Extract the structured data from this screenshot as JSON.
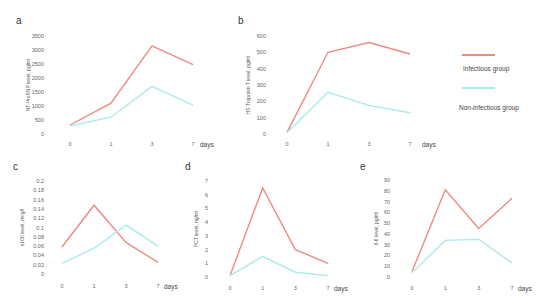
{
  "colors": {
    "infectious": "#f08a80",
    "non_infectious": "#a8ecec",
    "text": "#555555"
  },
  "legend": {
    "items": [
      {
        "label": "Infectious group",
        "color": "#f08a80"
      },
      {
        "label": "Non-infectious group",
        "color": "#a8ecec"
      }
    ]
  },
  "chart_data": [
    {
      "panel": "a",
      "type": "line",
      "title": "",
      "xlabel": "days",
      "ylabel": "NT-ProBNP level, pg/ml",
      "categories": [
        "0",
        "1",
        "3",
        "7"
      ],
      "yticks": [
        "0",
        "500",
        "1000",
        "1500",
        "2000",
        "2500",
        "3000",
        "3500"
      ],
      "ylim": [
        0,
        3500
      ],
      "grid": false,
      "series": [
        {
          "name": "Infectious group",
          "values": [
            320,
            1100,
            3150,
            2480
          ]
        },
        {
          "name": "Non-infectious group",
          "values": [
            290,
            600,
            1700,
            1030
          ]
        }
      ]
    },
    {
      "panel": "b",
      "type": "line",
      "title": "",
      "xlabel": "days",
      "ylabel": "HS Troponin T level, pg/ml",
      "categories": [
        "0",
        "1",
        "3",
        "7"
      ],
      "yticks": [
        "0",
        "100",
        "200",
        "300",
        "400",
        "500",
        "600"
      ],
      "ylim": [
        0,
        600
      ],
      "grid": false,
      "series": [
        {
          "name": "Infectious group",
          "values": [
            10,
            500,
            560,
            490
          ]
        },
        {
          "name": "Non-infectious group",
          "values": [
            10,
            255,
            175,
            130
          ]
        }
      ]
    },
    {
      "panel": "c",
      "type": "line",
      "title": "",
      "xlabel": "days",
      "ylabel": "s100 level, mcg/l",
      "categories": [
        "0",
        "1",
        "3",
        "7"
      ],
      "yticks": [
        "0",
        "0.02",
        "0.04",
        "0.06",
        "0.08",
        "0.1",
        "0.12",
        "0.14",
        "0.16",
        "0.18",
        "0.2"
      ],
      "ylim": [
        0,
        0.2
      ],
      "grid": false,
      "series": [
        {
          "name": "Infectious group",
          "values": [
            0.058,
            0.148,
            0.068,
            0.025
          ]
        },
        {
          "name": "Non-infectious group",
          "values": [
            0.023,
            0.055,
            0.105,
            0.06
          ]
        }
      ]
    },
    {
      "panel": "d",
      "type": "line",
      "title": "",
      "xlabel": "days",
      "ylabel": "PCT level, ng/ml",
      "categories": [
        "0",
        "1",
        "3",
        "7"
      ],
      "yticks": [
        "0",
        "1",
        "2",
        "3",
        "4",
        "5",
        "6",
        "7"
      ],
      "ylim": [
        0,
        7
      ],
      "grid": false,
      "series": [
        {
          "name": "Infectious group",
          "values": [
            0.1,
            6.5,
            2.0,
            1.0
          ]
        },
        {
          "name": "Non-infectious group",
          "values": [
            0.1,
            1.5,
            0.35,
            0.1
          ]
        }
      ]
    },
    {
      "panel": "e",
      "type": "line",
      "title": "",
      "xlabel": "days",
      "ylabel": "Il-6 level, pg/ml",
      "categories": [
        "0",
        "1",
        "3",
        "7"
      ],
      "yticks": [
        "0",
        "10",
        "20",
        "30",
        "40",
        "50",
        "60",
        "70",
        "80",
        "90"
      ],
      "ylim": [
        0,
        90
      ],
      "grid": false,
      "series": [
        {
          "name": "Infectious group",
          "values": [
            5,
            81,
            45,
            73
          ]
        },
        {
          "name": "Non-infectious group",
          "values": [
            4,
            34,
            35,
            13
          ]
        }
      ]
    }
  ],
  "layout": [
    {
      "panel": "a",
      "letter_pos": [
        16,
        16
      ],
      "plot": {
        "x0": 70,
        "x1": 193,
        "y0": 134,
        "ytop": 36
      },
      "ytick_x": 44,
      "ylabel_x": 30,
      "days_x": 200,
      "xtick_y": 146
    },
    {
      "panel": "b",
      "letter_pos": [
        238,
        16
      ],
      "plot": {
        "x0": 287,
        "x1": 410,
        "y0": 134,
        "ytop": 36
      },
      "ytick_x": 266,
      "ylabel_x": 250,
      "days_x": 422,
      "xtick_y": 146
    },
    {
      "panel": "c",
      "letter_pos": [
        13,
        162
      ],
      "plot": {
        "x0": 62,
        "x1": 158,
        "y0": 274,
        "ytop": 181
      },
      "ytick_x": 44,
      "ylabel_x": 24,
      "days_x": 164,
      "xtick_y": 288
    },
    {
      "panel": "d",
      "letter_pos": [
        185,
        162
      ],
      "plot": {
        "x0": 230,
        "x1": 328,
        "y0": 277,
        "ytop": 181
      },
      "ytick_x": 208,
      "ylabel_x": 198,
      "days_x": 334,
      "xtick_y": 290
    },
    {
      "panel": "e",
      "letter_pos": [
        360,
        162
      ],
      "plot": {
        "x0": 412,
        "x1": 512,
        "y0": 277,
        "ytop": 180
      },
      "ytick_x": 390,
      "ylabel_x": 378,
      "days_x": 518,
      "xtick_y": 290
    }
  ]
}
